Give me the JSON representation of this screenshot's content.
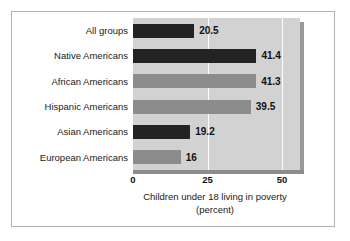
{
  "chart_data": {
    "type": "bar",
    "orientation": "horizontal",
    "title": "",
    "xlabel": "Children under 18 living in poverty",
    "xlabel_sub": "(percent)",
    "ylabel": "",
    "xlim": [
      0,
      56
    ],
    "xticks": [
      "0",
      "25",
      "50"
    ],
    "xtick_values": [
      0,
      25,
      50
    ],
    "grid": true,
    "gridlines_at": [
      25,
      50
    ],
    "legend": "none",
    "categories": [
      "All groups",
      "Native Americans",
      "African Americans",
      "Hispanic Americans",
      "Asian Americans",
      "European Americans"
    ],
    "values": [
      20.5,
      41.4,
      41.3,
      39.5,
      19.2,
      16
    ],
    "value_labels": [
      "20.5",
      "41.4",
      "41.3",
      "39.5",
      "19.2",
      "16"
    ],
    "bar_colors": [
      "dark",
      "dark",
      "light",
      "light",
      "dark",
      "light"
    ],
    "colors": {
      "dark_bar": "#232323",
      "light_bar": "#8c8c8c",
      "plot_background": "#d2d2d2",
      "gridline": "#ffffff",
      "axis_line": "#8c8c8c",
      "frame": "#b3b3b3",
      "shadow": "#9a9a9a",
      "text": "#1a1a1a",
      "page_background": "#ffffff"
    }
  }
}
